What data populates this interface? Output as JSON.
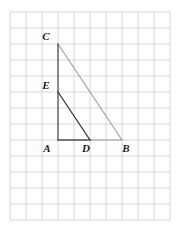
{
  "figure": {
    "background_color": "#ffffff",
    "grid": {
      "name": "square-grid",
      "origin_x": 10,
      "origin_y": 12,
      "cell_size": 16,
      "columns": 10,
      "rows": 13,
      "line_color": "#c9cdd4",
      "line_width": 0.8,
      "visible": true
    },
    "points": [
      {
        "id": "A",
        "label": "A",
        "x": 58,
        "y": 140,
        "grid_col": 3,
        "grid_row": 8,
        "label_dx": -11,
        "label_dy": 12
      },
      {
        "id": "B",
        "label": "B",
        "x": 122,
        "y": 140,
        "grid_col": 7,
        "grid_row": 8,
        "label_dx": 4,
        "label_dy": 12
      },
      {
        "id": "C",
        "label": "C",
        "x": 58,
        "y": 44,
        "grid_col": 3,
        "grid_row": 2,
        "label_dx": -12,
        "label_dy": -4
      },
      {
        "id": "D",
        "label": "D",
        "x": 90,
        "y": 140,
        "grid_col": 5,
        "grid_row": 8,
        "label_dx": -4,
        "label_dy": 12
      },
      {
        "id": "E",
        "label": "E",
        "x": 58,
        "y": 92,
        "grid_col": 3,
        "grid_row": 5,
        "label_dx": -12,
        "label_dy": -3
      }
    ],
    "segments": [
      {
        "name": "segment-CB-hypotenuse",
        "from": "C",
        "to": "B",
        "color": "#9a9a9a",
        "width": 1.1
      },
      {
        "name": "segment-CA-vertical-leg",
        "from": "C",
        "to": "A",
        "color": "#3a3a3a",
        "width": 1.1
      },
      {
        "name": "segment-AB-horizontal-leg",
        "from": "A",
        "to": "B",
        "color": "#9a9a9a",
        "width": 1.1
      },
      {
        "name": "segment-ED-inner-hypotenuse",
        "from": "E",
        "to": "D",
        "color": "#2b2b2b",
        "width": 1.2
      },
      {
        "name": "segment-AD-inner-base",
        "from": "A",
        "to": "D",
        "color": "#2b2b2b",
        "width": 1.2
      }
    ],
    "colors": {
      "outer_triangle": "#9a9a9a",
      "inner_triangle": "#2b2b2b",
      "grid": "#c9cdd4",
      "label": "#1a1a1a"
    }
  }
}
